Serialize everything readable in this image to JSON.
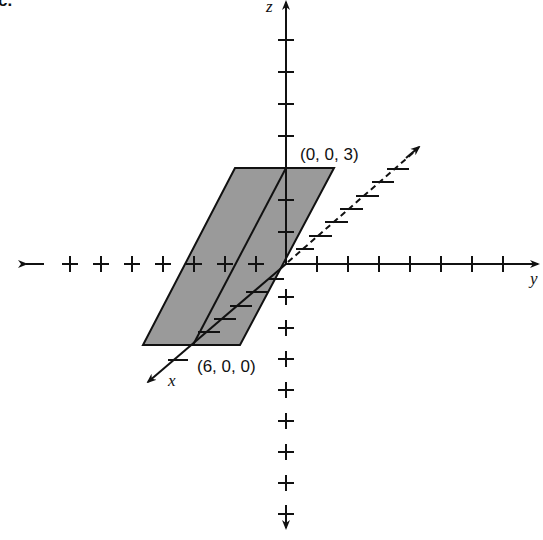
{
  "figure": {
    "partial_label": "c.",
    "axes": {
      "x": {
        "label": "x"
      },
      "y": {
        "label": "y"
      },
      "z": {
        "label": "z"
      }
    },
    "points": [
      {
        "label": "(0, 0, 3)",
        "coords": [
          0,
          0,
          3
        ]
      },
      {
        "label": "(6, 0, 0)",
        "coords": [
          6,
          0,
          0
        ]
      }
    ],
    "plane": {
      "description": "plane through (6,0,0) and (0,0,3), parallel to y-axis",
      "fill": "#9a9a9a",
      "stroke": "#111111"
    },
    "colors": {
      "ink": "#111111",
      "plane_fill": "#9a9a9a",
      "background": "#ffffff"
    }
  }
}
